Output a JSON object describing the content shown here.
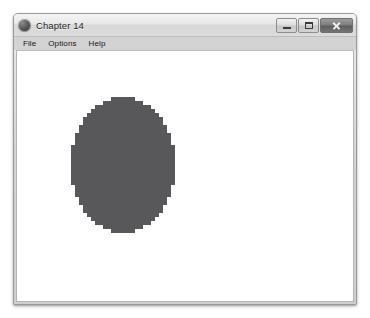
{
  "window": {
    "title": "Chapter 14",
    "icon": "app-circle-icon",
    "controls": [
      {
        "name": "minimize",
        "label": "Minimize",
        "glyph": "minimize-icon"
      },
      {
        "name": "maximize",
        "label": "Maximize",
        "glyph": "maximize-icon"
      },
      {
        "name": "close",
        "label": "Close",
        "glyph": "close-icon"
      }
    ]
  },
  "menu": {
    "items": [
      {
        "label": "File"
      },
      {
        "label": "Options"
      },
      {
        "label": "Help"
      }
    ]
  },
  "canvas": {
    "shape": {
      "type": "ellipse",
      "fill_color": "#58585a",
      "rendering": "pixelated-raster",
      "center_x": 122,
      "center_y": 165,
      "radius_x": 52,
      "radius_y": 68,
      "block_size": 4
    }
  },
  "colors": {
    "window_frame": "#d7d7d7",
    "title_bar": "#e9e9e9",
    "menu_bar": "#d3d3d3",
    "client_background": "#ffffff",
    "shape_fill": "#58585a",
    "page_background": "#ffffff"
  }
}
